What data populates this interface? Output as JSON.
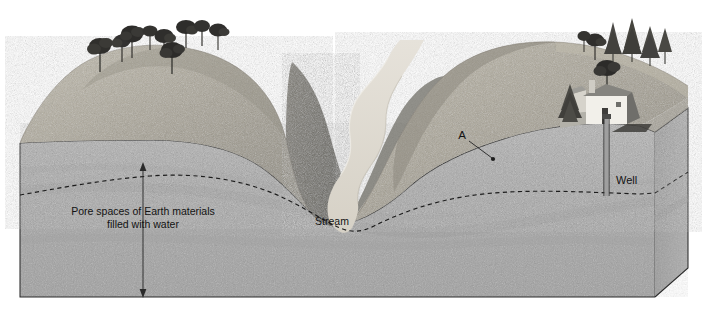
{
  "diagram": {
    "labels": {
      "pore_spaces_line1": "Pore spaces of Earth materials",
      "pore_spaces_line2": "filled with water",
      "stream": "Stream",
      "well": "Well",
      "point_a": "A"
    },
    "colors": {
      "background": "#ffffff",
      "subsurface": "#a9a9a9",
      "subsurface_dark": "#9b9b9b",
      "side_face": "#9d9d9d",
      "hill_light": "#b5b0a2",
      "hill_mid": "#9a958a",
      "hill_dark": "#6f6f68",
      "stream_water": "#ded9cf",
      "outline": "#2b2b2b",
      "water_table": "#1c1c1c",
      "tree_dark": "#2e2e2c",
      "conifer": "#4a4a46",
      "house_wall": "#f2f0ea",
      "house_roof": "#8d8d89",
      "text": "#131313"
    },
    "features": {
      "water_table_style": "dashed",
      "arrow_style": "double-headed-vertical",
      "well_depth_reaches": "water table",
      "valley_type": "v-shaped river valley",
      "tree_count_left_hill": 9,
      "tree_count_right_hill": 7,
      "building_count": 2
    }
  }
}
